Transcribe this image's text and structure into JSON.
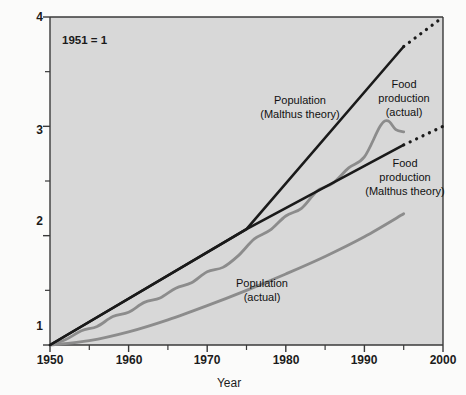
{
  "chart_data": {
    "type": "line",
    "title": "",
    "xlabel": "Year",
    "ylabel": "",
    "xlim": [
      1950,
      2000
    ],
    "ylim": [
      1,
      4
    ],
    "grid": false,
    "legend_position": "inline-annotations",
    "annotation": "1951 = 1",
    "x_ticks": [
      1950,
      1960,
      1970,
      1980,
      1990,
      2000
    ],
    "x_tick_labels": [
      "1950",
      "1960",
      "1970",
      "1980",
      "1990",
      "2000"
    ],
    "x_minor_ticks": [
      1955,
      1965,
      1975,
      1985,
      1995
    ],
    "y_ticks": [
      1,
      2,
      3,
      4
    ],
    "y_tick_labels": [
      "1",
      "2",
      "3",
      "4"
    ],
    "y_minor_ticks": [
      1.5,
      2.5,
      3.5
    ],
    "series": [
      {
        "name": "Population (Malthus theory)",
        "color": "#1a1a1a",
        "style": "solid-with-dotted-extension",
        "label_lines": [
          "Population",
          "(Malthus theory)"
        ],
        "points": [
          [
            1950,
            1.0
          ],
          [
            1975,
            2.06
          ],
          [
            1995,
            3.73
          ]
        ],
        "extrapolation_points": [
          [
            1995,
            3.73
          ],
          [
            2000,
            4.0
          ]
        ]
      },
      {
        "name": "Food production (Malthus theory)",
        "color": "#1a1a1a",
        "style": "solid-with-dotted-extension",
        "label_lines": [
          "Food",
          "production",
          "(Malthus theory)"
        ],
        "points": [
          [
            1950,
            1.0
          ],
          [
            1975,
            2.06
          ],
          [
            1995,
            2.83
          ]
        ],
        "extrapolation_points": [
          [
            1995,
            2.83
          ],
          [
            2000,
            3.0
          ]
        ]
      },
      {
        "name": "Food production (actual)",
        "color": "#8c8c8c",
        "style": "wiggly-solid",
        "label_lines": [
          "Food",
          "production",
          "(actual)"
        ],
        "points": [
          [
            1950,
            1.0
          ],
          [
            1952,
            1.05
          ],
          [
            1954,
            1.13
          ],
          [
            1956,
            1.17
          ],
          [
            1958,
            1.26
          ],
          [
            1960,
            1.3
          ],
          [
            1962,
            1.39
          ],
          [
            1964,
            1.43
          ],
          [
            1966,
            1.52
          ],
          [
            1968,
            1.57
          ],
          [
            1970,
            1.67
          ],
          [
            1972,
            1.71
          ],
          [
            1974,
            1.82
          ],
          [
            1976,
            1.97
          ],
          [
            1978,
            2.05
          ],
          [
            1980,
            2.18
          ],
          [
            1982,
            2.25
          ],
          [
            1984,
            2.41
          ],
          [
            1986,
            2.48
          ],
          [
            1988,
            2.62
          ],
          [
            1990,
            2.72
          ],
          [
            1992,
            3.0
          ],
          [
            1993,
            3.05
          ],
          [
            1994,
            2.97
          ],
          [
            1995,
            2.95
          ]
        ]
      },
      {
        "name": "Population (actual)",
        "color": "#8c8c8c",
        "style": "smooth-solid",
        "label_lines": [
          "Population",
          "(actual)"
        ],
        "points": [
          [
            1950,
            1.0
          ],
          [
            1955,
            1.04
          ],
          [
            1960,
            1.12
          ],
          [
            1965,
            1.23
          ],
          [
            1970,
            1.36
          ],
          [
            1975,
            1.5
          ],
          [
            1980,
            1.65
          ],
          [
            1985,
            1.81
          ],
          [
            1990,
            1.99
          ],
          [
            1995,
            2.2
          ]
        ]
      }
    ]
  },
  "labels": {
    "population_malthus": {
      "line1": "Population",
      "line2": "(Malthus theory)"
    },
    "food_actual": {
      "line1": "Food",
      "line2": "production",
      "line3": "(actual)"
    },
    "food_malthus": {
      "line1": "Food",
      "line2": "production",
      "line3": "(Malthus theory)"
    },
    "population_actual": {
      "line1": "Population",
      "line2": "(actual)"
    }
  },
  "axis": {
    "x_title": "Year",
    "x_tick_1950": "1950",
    "x_tick_1960": "1960",
    "x_tick_1970": "1970",
    "x_tick_1980": "1980",
    "x_tick_1990": "1990",
    "x_tick_2000": "2000",
    "y_tick_1": "1",
    "y_tick_2": "2",
    "y_tick_3": "3",
    "y_tick_4": "4"
  },
  "note": {
    "baseline": "1951 = 1"
  },
  "colors": {
    "page_background": "#fbfbfa",
    "plot_background": "#d8d8d8",
    "theory_line": "#1a1a1a",
    "actual_line": "#8c8c8c",
    "axis": "#3a3a3a",
    "text": "#1b1b1b"
  }
}
